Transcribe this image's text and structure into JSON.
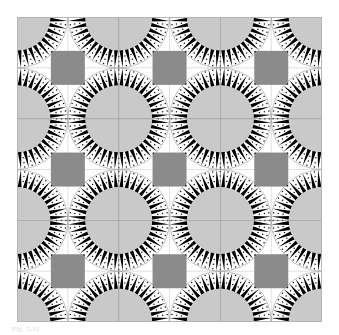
{
  "figure": {
    "caption": "Fig. 5.32",
    "canvas": {
      "width": 339,
      "height": 335
    },
    "plot_area": {
      "x": 17,
      "y": 17,
      "width": 305,
      "height": 305
    }
  },
  "colors": {
    "background": "#ffffff",
    "paper": "#ffffff",
    "ray_black": "#000000",
    "disc_gray": "#c9c9c9",
    "square_gray": "#8b8b8b",
    "grid_line": "#9a9a9a",
    "thin_arc": "#8f8f8f",
    "dot": "#111111",
    "border": "#b4b4b4",
    "caption_text": "#d8d8d8"
  },
  "pattern": {
    "name": "sunburst-lattice",
    "tile_size": 101.7,
    "tiles_across": 3,
    "tiles_down": 3,
    "disc_radius": 33.5,
    "ray_outer_radius": 50.8,
    "ray_count": 40,
    "ray_half_angle_deg": 3.3,
    "square_side": 34.0,
    "dot_radius": 0.75,
    "dot_rings": [
      39.5,
      44.5,
      49.0
    ],
    "dots_per_ring": 40,
    "grid_line_width": 0.9,
    "arc_line_width": 0.6
  },
  "chart_data": {
    "type": "scatter",
    "xlabel": "",
    "ylabel": "",
    "lattice": {
      "period": 101.7,
      "origin": [
        0,
        0
      ],
      "centers_x": [
        0,
        101.7,
        203.4,
        305.1
      ],
      "centers_y": [
        0,
        101.7,
        203.4,
        305.1
      ]
    },
    "motif": {
      "disc_radius": 33.5,
      "rays": 40,
      "ray_length": 17.3,
      "square_offset": [
        50.85,
        50.85
      ],
      "square_side": 34.0
    },
    "legend": [],
    "grid": true
  }
}
